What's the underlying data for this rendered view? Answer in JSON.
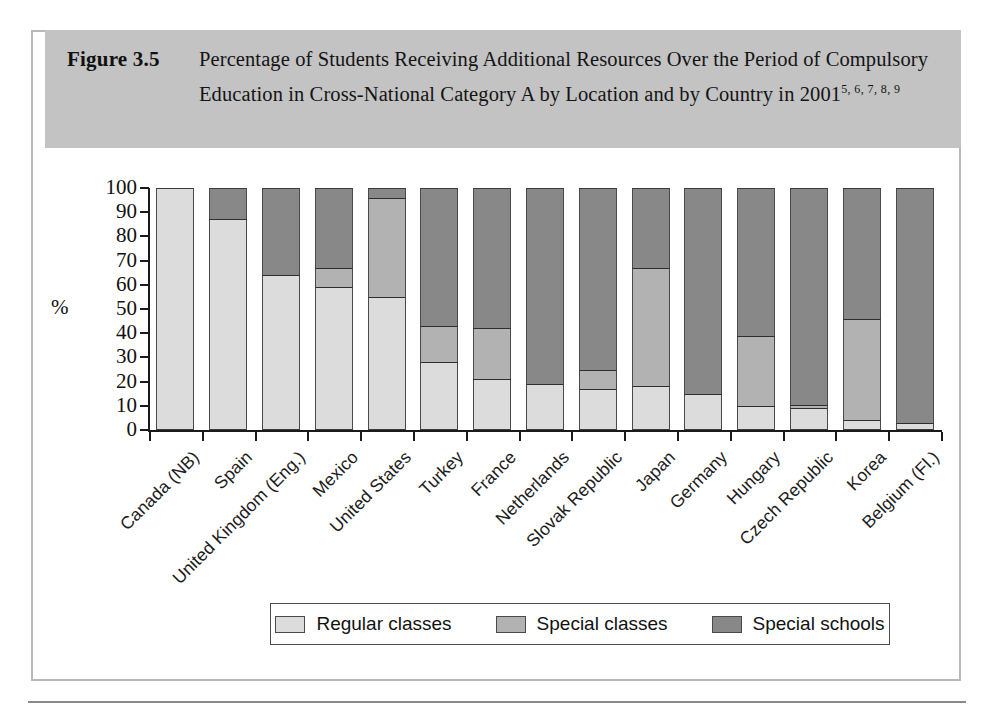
{
  "figure": {
    "number_label": "Figure 3.5",
    "title": "Percentage of Students Receiving Additional Resources Over the Period of Compulsory Education in Cross-National Category A by Location and by Country in 2001",
    "title_superscript": "5, 6, 7, 8, 9"
  },
  "legend": {
    "items": [
      {
        "label": "Regular classes",
        "key": "regular",
        "color": "#dcdcdc"
      },
      {
        "label": "Special classes",
        "key": "special_classes",
        "color": "#b2b2b2"
      },
      {
        "label": "Special schools",
        "key": "special_schools",
        "color": "#888888"
      }
    ]
  },
  "chart_data": {
    "type": "bar",
    "stacked": true,
    "title": "Percentage of Students Receiving Additional Resources Over the Period of Compulsory Education in Cross-National Category A by Location and by Country in 2001",
    "xlabel": "",
    "ylabel": "%",
    "ylim": [
      0,
      100
    ],
    "yticks": [
      0,
      10,
      20,
      30,
      40,
      50,
      60,
      70,
      80,
      90,
      100
    ],
    "ytick_labels": [
      "0",
      "10",
      "20",
      "30",
      "40",
      "50",
      "60",
      "70",
      "80",
      "90",
      "100"
    ],
    "grid": false,
    "legend_position": "bottom",
    "categories": [
      "Canada (NB)",
      "Spain",
      "United Kingdom (Eng.)",
      "Mexico",
      "United States",
      "Turkey",
      "France",
      "Netherlands",
      "Slovak Republic",
      "Japan",
      "Germany",
      "Hungary",
      "Czech Republic",
      "Korea",
      "Belgium (Fl.)"
    ],
    "series": [
      {
        "name": "Regular classes",
        "key": "regular",
        "color": "#dcdcdc",
        "values": [
          100,
          87,
          64,
          59,
          55,
          28,
          21,
          19,
          17,
          18,
          15,
          10,
          9,
          4,
          3
        ]
      },
      {
        "name": "Special classes",
        "key": "special_classes",
        "color": "#b2b2b2",
        "values": [
          0,
          0,
          0,
          8,
          41,
          15,
          21,
          0,
          8,
          49,
          0,
          29,
          1.5,
          42,
          0
        ]
      },
      {
        "name": "Special schools",
        "key": "special_schools",
        "color": "#888888",
        "values": [
          0,
          13,
          36,
          33,
          4,
          57,
          58,
          81,
          75,
          33,
          85,
          61,
          89.5,
          54,
          97
        ]
      }
    ]
  }
}
